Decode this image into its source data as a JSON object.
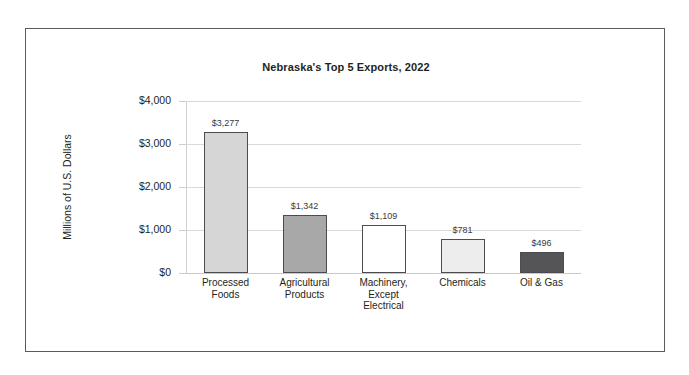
{
  "chart_data": {
    "type": "bar",
    "title": "Nebraska's Top 5 Exports, 2022",
    "xlabel": "",
    "ylabel": "Millions of U.S. Dollars",
    "categories": [
      "Processed Foods",
      "Agricultural Products",
      "Machinery, Except Electrical",
      "Chemicals",
      "Oil & Gas"
    ],
    "values": [
      3277,
      1342,
      1109,
      781,
      496
    ],
    "value_labels": [
      "$3,277",
      "$1,342",
      "$1,109",
      "$781",
      "$496"
    ],
    "bar_colors": [
      "#d6d6d6",
      "#a8a8a8",
      "#ffffff",
      "#ededed",
      "#555558"
    ],
    "bar_border_color": "#4c4c50",
    "ylim": [
      0,
      4000
    ],
    "yticks": [
      0,
      1000,
      2000,
      3000,
      4000
    ],
    "ytick_labels": [
      "$0",
      "$1,000",
      "$2,000",
      "$3,000",
      "$4,000"
    ],
    "grid": true,
    "legend": false,
    "legend_position": "none"
  },
  "axis": {
    "y_labels": [
      "$4,000",
      "$3,000",
      "$2,000",
      "$1,000",
      "$0"
    ],
    "y_title": "Millions of U.S. Dollars"
  },
  "categories_display": [
    [
      "Processed",
      "Foods"
    ],
    [
      "Agricultural",
      "Products"
    ],
    [
      "Machinery,",
      "Except",
      "Electrical"
    ],
    [
      "Chemicals"
    ],
    [
      "Oil & Gas"
    ]
  ]
}
